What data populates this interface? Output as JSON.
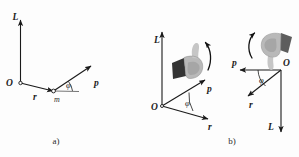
{
  "figure": {
    "background_color": "#fdfdfd",
    "ink_color": "#1a1a1a",
    "hand_color": "#b9b9b9",
    "cuff_color": "#343434"
  },
  "panel_a": {
    "caption": "a)",
    "origin_label": "O",
    "axis_L_label": "L",
    "vector_r_label": "r",
    "vector_p_label": "p",
    "mass_label": "m",
    "angle_label": "φ"
  },
  "panel_b": {
    "caption": "b)",
    "left": {
      "origin_label": "O",
      "axis_L_label": "L",
      "vector_p_label": "p",
      "vector_r_label": "r",
      "angle_label": "φ",
      "hand_icon": "right-hand-thumb-up",
      "rotation_icon": "curved-rotation-arrow-counterclockwise"
    },
    "right": {
      "origin_label": "O",
      "axis_L_label": "L",
      "vector_p_label": "p",
      "vector_r_label": "r",
      "angle_label": "φ",
      "hand_icon": "right-hand-thumb-down",
      "rotation_icon": "curved-rotation-arrow-clockwise"
    }
  }
}
